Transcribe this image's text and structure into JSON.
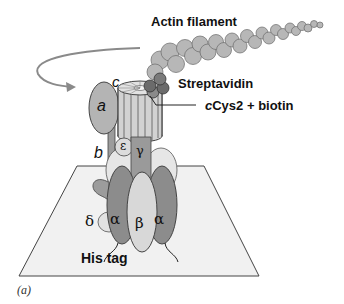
{
  "figure": {
    "panel_label": "(a)",
    "labels": {
      "actin": "Actin filament",
      "streptavidin": "Streptavidin",
      "ccys2_prefix": "c",
      "ccys2_rest": "Cys2 + biotin",
      "his_tag": "His tag"
    },
    "subunits": {
      "a": "a",
      "b": "b",
      "c": "c",
      "epsilon": "ε",
      "gamma": "γ",
      "delta": "δ",
      "alpha_left": "α",
      "beta": "β",
      "alpha_right": "α"
    },
    "colors": {
      "actin": "#b7b7b7",
      "streptavidin": "#6b6b6b",
      "rotor": "#d2d2d2",
      "subunit_a": "#b4b4b4",
      "alpha": "#8c8c8c",
      "beta": "#d8d8d8",
      "gamma": "#9a9a9a",
      "plate": "#f1f1f1",
      "arrow": "#8a8a8a"
    }
  }
}
